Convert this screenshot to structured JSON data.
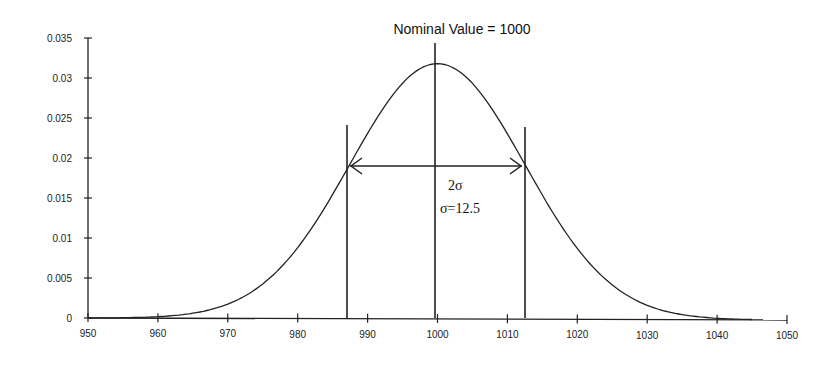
{
  "chart_data": {
    "type": "line",
    "title": "Nominal Value = 1000",
    "xlabel": "",
    "ylabel": "",
    "xlim": [
      950,
      1050
    ],
    "ylim": [
      0,
      0.035
    ],
    "grid": false,
    "x_ticks": [
      950,
      960,
      970,
      980,
      990,
      1000,
      1010,
      1020,
      1030,
      1040,
      1050
    ],
    "y_ticks": [
      0,
      0.005,
      0.01,
      0.015,
      0.02,
      0.025,
      0.03,
      0.035
    ],
    "x_tick_labels": [
      "950",
      "960",
      "970",
      "980",
      "990",
      "1000",
      "1010",
      "1020",
      "1030",
      "1040",
      "1050"
    ],
    "y_tick_labels": [
      "0",
      "0.005",
      "0.01",
      "0.015",
      "0.02",
      "0.025",
      "0.03",
      "0.035"
    ],
    "series": [
      {
        "name": "Normal distribution (mean=1000, sigma=12.5)",
        "mean": 1000,
        "sigma": 12.5,
        "x": [
          950,
          960,
          970,
          975,
          980,
          985,
          987.5,
          990,
          995,
          1000,
          1005,
          1010,
          1012.5,
          1015,
          1020,
          1025,
          1030,
          1040,
          1050
        ],
        "values": [
          0.0001,
          0.0004,
          0.0018,
          0.0045,
          0.009,
          0.015,
          0.0194,
          0.0232,
          0.0294,
          0.0319,
          0.0294,
          0.0232,
          0.0194,
          0.015,
          0.009,
          0.0045,
          0.0018,
          0.0004,
          0.0001
        ]
      }
    ],
    "vertical_lines": [
      {
        "x": 987.5,
        "label": "mean - sigma"
      },
      {
        "x": 1000,
        "label": "Nominal Value"
      },
      {
        "x": 1012.5,
        "label": "mean + sigma"
      }
    ],
    "annotations": [
      {
        "text": "Nominal Value = 1000",
        "position": "top-center"
      },
      {
        "text": "2σ",
        "type": "double-arrow",
        "from_x": 987.5,
        "to_x": 1012.5,
        "y": 0.0191
      },
      {
        "text": "σ=12.5"
      }
    ]
  },
  "labels": {
    "title": "Nominal Value = 1000",
    "two_sigma": "2σ",
    "sigma_value": "σ=12.5"
  }
}
